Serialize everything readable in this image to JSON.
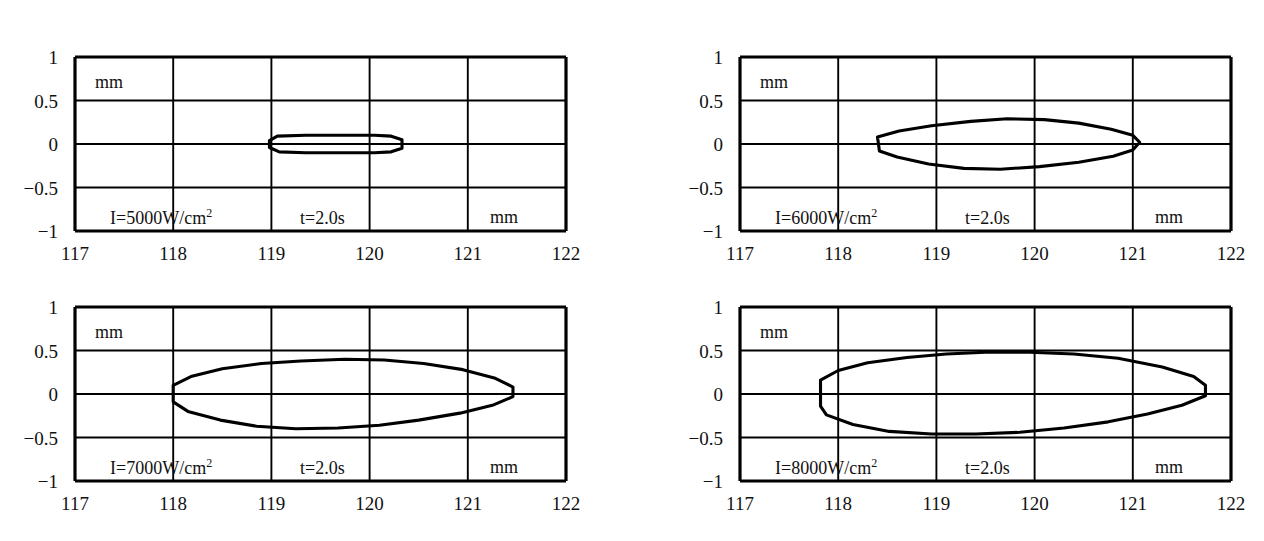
{
  "figure": {
    "panel_count": 4,
    "line_color": "#000000",
    "frame_color": "#000000",
    "background": "#ffffff",
    "caption_partial": ""
  },
  "axes": {
    "xticks": [
      "117",
      "118",
      "119",
      "120",
      "121",
      "122"
    ],
    "xtick_values": [
      117,
      118,
      119,
      120,
      121,
      122
    ],
    "yticks": [
      "1",
      "0.5",
      "0",
      "−0.5",
      "−1"
    ],
    "ytick_values": [
      1,
      0.5,
      0,
      -0.5,
      -1
    ],
    "xlim": [
      117,
      122
    ],
    "ylim": [
      -1,
      1
    ],
    "unit_top_left": "mm",
    "unit_bottom_right": "mm",
    "grid": true
  },
  "chart_data": {
    "type": "line",
    "title": "",
    "xlabel": "mm",
    "ylabel": "mm",
    "xlim": [
      117,
      122
    ],
    "ylim": [
      -1,
      1
    ],
    "grid": true,
    "legend": "none",
    "panels": [
      {
        "id": "panel-5000",
        "intensity_label": "I=5000W/cm",
        "intensity_exponent": "2",
        "intensity_value": 5000,
        "intensity_units": "W/cm^2",
        "time_label": "t=2.0s",
        "time_value": 2.0,
        "x_start": 118.98,
        "x_end": 120.33,
        "y_max": 0.1,
        "y_min": -0.1,
        "outline": [
          [
            118.98,
            0.04
          ],
          [
            119.06,
            0.09
          ],
          [
            119.35,
            0.1
          ],
          [
            119.7,
            0.1
          ],
          [
            120.05,
            0.1
          ],
          [
            120.22,
            0.09
          ],
          [
            120.33,
            0.05
          ],
          [
            120.33,
            -0.05
          ],
          [
            120.22,
            -0.09
          ],
          [
            120.05,
            -0.1
          ],
          [
            119.7,
            -0.1
          ],
          [
            119.35,
            -0.1
          ],
          [
            119.08,
            -0.09
          ],
          [
            118.98,
            -0.04
          ]
        ]
      },
      {
        "id": "panel-6000",
        "intensity_label": "I=6000W/cm",
        "intensity_exponent": "2",
        "intensity_value": 6000,
        "intensity_units": "W/cm^2",
        "time_label": "t=2.0s",
        "time_value": 2.0,
        "x_start": 118.4,
        "x_end": 121.07,
        "y_max": 0.29,
        "y_min": -0.29,
        "outline": [
          [
            118.4,
            0.08
          ],
          [
            118.62,
            0.15
          ],
          [
            118.95,
            0.21
          ],
          [
            119.35,
            0.26
          ],
          [
            119.72,
            0.29
          ],
          [
            120.1,
            0.28
          ],
          [
            120.45,
            0.24
          ],
          [
            120.78,
            0.17
          ],
          [
            121.0,
            0.1
          ],
          [
            121.07,
            0.02
          ],
          [
            121.0,
            -0.07
          ],
          [
            120.8,
            -0.14
          ],
          [
            120.45,
            -0.21
          ],
          [
            120.05,
            -0.26
          ],
          [
            119.65,
            -0.29
          ],
          [
            119.28,
            -0.28
          ],
          [
            118.92,
            -0.23
          ],
          [
            118.6,
            -0.15
          ],
          [
            118.42,
            -0.08
          ]
        ]
      },
      {
        "id": "panel-7000",
        "intensity_label": "I=7000W/cm",
        "intensity_exponent": "2",
        "intensity_value": 7000,
        "intensity_units": "W/cm^2",
        "time_label": "t=2.0s",
        "time_value": 2.0,
        "x_start": 118.0,
        "x_end": 121.46,
        "y_max": 0.4,
        "y_min": -0.4,
        "outline": [
          [
            118.0,
            0.1
          ],
          [
            118.18,
            0.2
          ],
          [
            118.5,
            0.29
          ],
          [
            118.9,
            0.35
          ],
          [
            119.3,
            0.38
          ],
          [
            119.75,
            0.4
          ],
          [
            120.15,
            0.39
          ],
          [
            120.55,
            0.35
          ],
          [
            120.95,
            0.28
          ],
          [
            121.28,
            0.18
          ],
          [
            121.46,
            0.08
          ],
          [
            121.46,
            -0.03
          ],
          [
            121.25,
            -0.13
          ],
          [
            120.92,
            -0.22
          ],
          [
            120.5,
            -0.3
          ],
          [
            120.1,
            -0.36
          ],
          [
            119.68,
            -0.39
          ],
          [
            119.25,
            -0.4
          ],
          [
            118.85,
            -0.37
          ],
          [
            118.48,
            -0.3
          ],
          [
            118.15,
            -0.2
          ],
          [
            118.0,
            -0.09
          ]
        ]
      },
      {
        "id": "panel-8000",
        "intensity_label": "I=8000W/cm",
        "intensity_exponent": "2",
        "intensity_value": 8000,
        "intensity_units": "W/cm^2",
        "time_label": "t=2.0s",
        "time_value": 2.0,
        "x_start": 117.82,
        "x_end": 121.74,
        "y_max": 0.48,
        "y_min": -0.48,
        "outline": [
          [
            117.82,
            0.16
          ],
          [
            118.0,
            0.27
          ],
          [
            118.3,
            0.36
          ],
          [
            118.7,
            0.42
          ],
          [
            119.1,
            0.46
          ],
          [
            119.5,
            0.48
          ],
          [
            119.95,
            0.48
          ],
          [
            120.4,
            0.46
          ],
          [
            120.85,
            0.41
          ],
          [
            121.3,
            0.31
          ],
          [
            121.62,
            0.2
          ],
          [
            121.74,
            0.1
          ],
          [
            121.74,
            -0.02
          ],
          [
            121.5,
            -0.13
          ],
          [
            121.15,
            -0.23
          ],
          [
            120.75,
            -0.32
          ],
          [
            120.3,
            -0.39
          ],
          [
            119.85,
            -0.44
          ],
          [
            119.4,
            -0.46
          ],
          [
            118.95,
            -0.46
          ],
          [
            118.52,
            -0.43
          ],
          [
            118.15,
            -0.35
          ],
          [
            117.88,
            -0.24
          ],
          [
            117.82,
            -0.14
          ]
        ]
      }
    ]
  }
}
